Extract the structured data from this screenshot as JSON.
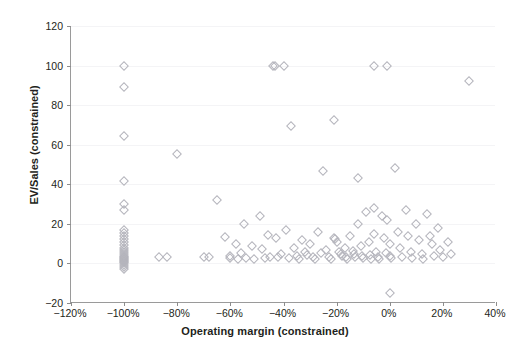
{
  "chart_data": {
    "type": "scatter",
    "title": "",
    "xlabel": "Operating margin (constrained)",
    "ylabel": "EV/Sales (constrained)",
    "xlim": [
      -120,
      40
    ],
    "ylim": [
      -20,
      120
    ],
    "xticks": [
      -120,
      -100,
      -80,
      -60,
      -40,
      -20,
      0,
      20,
      40
    ],
    "xtick_labels": [
      "−120%",
      "−100%",
      "−80%",
      "−60%",
      "−40%",
      "−20%",
      "0%",
      "20%",
      "40%"
    ],
    "yticks": [
      -20,
      0,
      20,
      40,
      60,
      80,
      100,
      120
    ],
    "ytick_labels": [
      "−20",
      "0",
      "20",
      "40",
      "60",
      "80",
      "100",
      "120"
    ],
    "grid": true,
    "grid_axis": "y",
    "marker": "diamond-open",
    "marker_color": "#b4b4bc",
    "series": [
      {
        "name": "companies",
        "points": [
          [
            -100,
            100
          ],
          [
            -100,
            89
          ],
          [
            -100,
            64.5
          ],
          [
            -100,
            41.5
          ],
          [
            -100,
            30
          ],
          [
            -100,
            27
          ],
          [
            -100,
            17
          ],
          [
            -100,
            15.5
          ],
          [
            -100,
            14
          ],
          [
            -100,
            12.5
          ],
          [
            -100,
            11
          ],
          [
            -100,
            9.5
          ],
          [
            -100,
            8
          ],
          [
            -100,
            7
          ],
          [
            -100,
            6
          ],
          [
            -100,
            5
          ],
          [
            -100,
            4
          ],
          [
            -100,
            3
          ],
          [
            -100,
            2.5
          ],
          [
            -100,
            2
          ],
          [
            -100,
            1.5
          ],
          [
            -100,
            1
          ],
          [
            -100,
            0.5
          ],
          [
            -100,
            0
          ],
          [
            -100,
            -1
          ],
          [
            -100,
            -2
          ],
          [
            -100,
            -3
          ],
          [
            -87,
            3.5
          ],
          [
            -84,
            3.5
          ],
          [
            -80,
            55.5
          ],
          [
            -70,
            3
          ],
          [
            -68,
            3
          ],
          [
            -65,
            32
          ],
          [
            -62,
            13.5
          ],
          [
            -60,
            4
          ],
          [
            -60,
            2.5
          ],
          [
            -58,
            10
          ],
          [
            -57,
            2
          ],
          [
            -56,
            5.5
          ],
          [
            -55,
            20
          ],
          [
            -54,
            2.5
          ],
          [
            -52,
            9
          ],
          [
            -51,
            2
          ],
          [
            -49,
            24
          ],
          [
            -48,
            7.5
          ],
          [
            -47,
            2.5
          ],
          [
            -46,
            14.5
          ],
          [
            -45,
            3
          ],
          [
            -44,
            100
          ],
          [
            -43.3,
            100
          ],
          [
            -43,
            13
          ],
          [
            -42,
            3.5
          ],
          [
            -41,
            5
          ],
          [
            -40,
            100
          ],
          [
            -39,
            17
          ],
          [
            -38,
            2.5
          ],
          [
            -37,
            69.5
          ],
          [
            -36,
            8
          ],
          [
            -35,
            4
          ],
          [
            -34,
            2
          ],
          [
            -33,
            12
          ],
          [
            -32,
            6
          ],
          [
            -31,
            4.5
          ],
          [
            -30,
            10
          ],
          [
            -29,
            3
          ],
          [
            -28,
            2
          ],
          [
            -27,
            16
          ],
          [
            -26,
            5.5
          ],
          [
            -25,
            46.5
          ],
          [
            -24,
            7
          ],
          [
            -23,
            3.5
          ],
          [
            -22,
            2
          ],
          [
            -21,
            72.5
          ],
          [
            -21,
            13
          ],
          [
            -20.5,
            12.5
          ],
          [
            -20,
            11
          ],
          [
            -19,
            6
          ],
          [
            -18.5,
            5
          ],
          [
            -18,
            4
          ],
          [
            -17,
            8
          ],
          [
            -16.5,
            3
          ],
          [
            -16,
            2
          ],
          [
            -15,
            14
          ],
          [
            -14,
            6.5
          ],
          [
            -13.5,
            5
          ],
          [
            -13,
            3
          ],
          [
            -12,
            43
          ],
          [
            -12,
            20
          ],
          [
            -11,
            9
          ],
          [
            -10.5,
            4
          ],
          [
            -10,
            2.5
          ],
          [
            -9,
            26
          ],
          [
            -8,
            11
          ],
          [
            -7.5,
            4.5
          ],
          [
            -7,
            2
          ],
          [
            -6,
            100
          ],
          [
            -6,
            28
          ],
          [
            -6,
            15
          ],
          [
            -5,
            6
          ],
          [
            -4.5,
            3
          ],
          [
            -4,
            2
          ],
          [
            -3,
            24
          ],
          [
            -2,
            13
          ],
          [
            -1.5,
            5.5
          ],
          [
            -1,
            100
          ],
          [
            -1,
            22
          ],
          [
            0,
            10
          ],
          [
            0,
            4
          ],
          [
            0.5,
            2.5
          ],
          [
            0,
            -15
          ],
          [
            2,
            48
          ],
          [
            3,
            16
          ],
          [
            4,
            8
          ],
          [
            4.5,
            3
          ],
          [
            6,
            27
          ],
          [
            7,
            14
          ],
          [
            8,
            6
          ],
          [
            8.5,
            2.5
          ],
          [
            10,
            20
          ],
          [
            11,
            12
          ],
          [
            12,
            5
          ],
          [
            12.5,
            2
          ],
          [
            14,
            25
          ],
          [
            15,
            14
          ],
          [
            16,
            10
          ],
          [
            16.5,
            4
          ],
          [
            18,
            18
          ],
          [
            19,
            7
          ],
          [
            20,
            3
          ],
          [
            22,
            11
          ],
          [
            23,
            5
          ],
          [
            30,
            92
          ]
        ]
      }
    ]
  }
}
